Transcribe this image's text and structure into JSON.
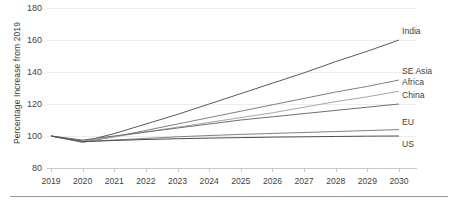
{
  "chart_data": {
    "type": "line",
    "title": "",
    "xlabel": "",
    "ylabel": "Percentage Increase from 2019",
    "x": [
      2019,
      2020,
      2021,
      2022,
      2023,
      2024,
      2025,
      2026,
      2027,
      2028,
      2029,
      2030
    ],
    "xtick_labels": [
      "2019",
      "2020",
      "2021",
      "2022",
      "2023",
      "2024",
      "2025",
      "2026",
      "2027",
      "2028",
      "2029",
      "2030"
    ],
    "ytick_labels": [
      "80",
      "100",
      "120",
      "140",
      "160",
      "180"
    ],
    "yticks": [
      80,
      100,
      120,
      140,
      160,
      180
    ],
    "ylim": [
      80,
      180
    ],
    "grid": true,
    "legend_position": "line-end-labels",
    "series": [
      {
        "name": "India",
        "color": "#595959",
        "values": [
          100,
          96.5,
          101.5,
          107.5,
          113.5,
          120,
          126.5,
          133,
          139.5,
          146.5,
          153,
          160
        ]
      },
      {
        "name": "SE Asia",
        "color": "#7f7f7f",
        "values": [
          100,
          96,
          99.5,
          103.5,
          107.5,
          111.5,
          115.5,
          119.5,
          123.5,
          127.5,
          131,
          135
        ]
      },
      {
        "name": "Africa",
        "color": "#a6a6a6",
        "values": [
          100,
          97,
          99.5,
          102.5,
          105.5,
          108.5,
          111.5,
          114.5,
          118,
          121.5,
          124.5,
          128
        ]
      },
      {
        "name": "China",
        "color": "#6e6e6e",
        "values": [
          100,
          97.5,
          100,
          102.5,
          105,
          107.5,
          110,
          112,
          114,
          116,
          118,
          120
        ]
      },
      {
        "name": "EU",
        "color": "#808080",
        "values": [
          100,
          96.5,
          97.5,
          98.5,
          99.5,
          100.3,
          101,
          101.6,
          102.2,
          102.8,
          103.4,
          104
        ]
      },
      {
        "name": "US",
        "color": "#4d4d4d",
        "values": [
          100,
          96.5,
          97.2,
          97.8,
          98.3,
          98.7,
          99,
          99.3,
          99.5,
          99.7,
          99.9,
          100
        ]
      }
    ]
  }
}
